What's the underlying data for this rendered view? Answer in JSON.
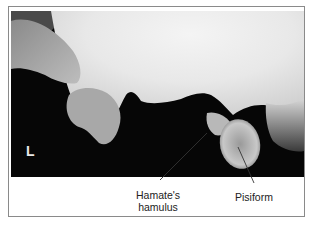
{
  "figure": {
    "side_marker": "L",
    "labels": {
      "hamulus": [
        "Hamate's",
        "hamulus"
      ],
      "pisiform": "Pisiform"
    }
  }
}
